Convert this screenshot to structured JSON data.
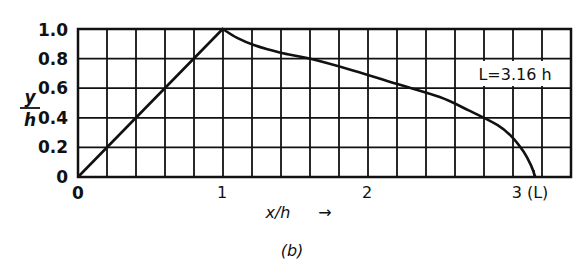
{
  "chart_data": {
    "type": "line",
    "title": "",
    "caption": "(b)",
    "xlabel": "x/h →",
    "ylabel": "y/h",
    "xlim": [
      0,
      3.4
    ],
    "ylim": [
      0,
      1.0
    ],
    "grid": true,
    "x_tick_labels": [
      "0",
      "1",
      "2",
      "3 (L)"
    ],
    "x_ticks": [
      0,
      1,
      2,
      3
    ],
    "y_tick_labels": [
      "0",
      "0.2",
      "0.4",
      "0.6",
      "0.8",
      "1.0"
    ],
    "y_ticks": [
      0,
      0.2,
      0.4,
      0.6,
      0.8,
      1.0
    ],
    "annotation": "L = 3.16 h",
    "series": [
      {
        "name": "profile",
        "x": [
          0,
          1.0,
          1.1,
          1.22,
          1.4,
          1.6,
          1.9,
          2.2,
          2.5,
          2.7,
          2.9,
          3.0,
          3.08,
          3.13,
          3.16
        ],
        "y": [
          0,
          1.0,
          0.94,
          0.89,
          0.84,
          0.8,
          0.72,
          0.63,
          0.54,
          0.45,
          0.35,
          0.27,
          0.17,
          0.08,
          0.0
        ]
      }
    ]
  },
  "labels": {
    "y_axis_num": "y",
    "y_axis_den": "h",
    "x_axis": "x/h",
    "x_arrow": "→",
    "annotation": "L=3.16 h",
    "caption": "(b)",
    "origin_x": "0",
    "y_ticks": [
      "0",
      "0.2",
      "0.4",
      "0.6",
      "0.8",
      "1.0"
    ],
    "x_ticks": [
      "1",
      "2",
      "3 (L)"
    ]
  }
}
